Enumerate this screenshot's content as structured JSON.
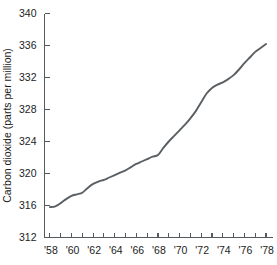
{
  "chart_data": {
    "type": "line",
    "title": "",
    "subtitle": "",
    "xlabel": "",
    "ylabel": "Carbon dioxide (parts per million)",
    "xlim": [
      1957.5,
      1978.6
    ],
    "ylim": [
      312,
      340
    ],
    "grid": false,
    "legend": "none",
    "line_color": "#5a5f63",
    "axis_color": "#555a5e",
    "background_color": "#ffffff",
    "y_ticks": [
      312,
      316,
      320,
      324,
      328,
      332,
      336,
      340
    ],
    "y_tick_labels": [
      "312",
      "316",
      "320",
      "324",
      "328",
      "332",
      "336",
      "340"
    ],
    "x_ticks": [
      1958,
      1959,
      1960,
      1961,
      1962,
      1963,
      1964,
      1965,
      1966,
      1967,
      1968,
      1969,
      1970,
      1971,
      1972,
      1973,
      1974,
      1975,
      1976,
      1977,
      1978
    ],
    "x_tick_labels": [
      "'58",
      "",
      "'60",
      "",
      "'62",
      "",
      "'64",
      "",
      "'66",
      "",
      "'68",
      "",
      "'70",
      "",
      "'72",
      "",
      "'74",
      "",
      "'76",
      "",
      "'78"
    ],
    "x_labeled_years": [
      1958,
      1960,
      1962,
      1964,
      1966,
      1968,
      1970,
      1972,
      1974,
      1976,
      1978
    ],
    "x_labeled_text": [
      "'58",
      "'60",
      "'62",
      "'64",
      "'66",
      "'68",
      "'70",
      "'72",
      "'74",
      "'76",
      "'78"
    ],
    "series": [
      {
        "name": "Atmospheric carbon dioxide concentration",
        "x": [
          1958,
          1958.5,
          1959,
          1959.5,
          1960,
          1960.5,
          1961,
          1961.5,
          1962,
          1962.5,
          1963,
          1963.5,
          1964,
          1964.5,
          1965,
          1965.5,
          1966,
          1966.5,
          1967,
          1967.5,
          1968,
          1968.5,
          1969,
          1969.5,
          1970,
          1970.5,
          1971,
          1971.5,
          1972,
          1972.5,
          1973,
          1973.5,
          1974,
          1974.5,
          1975,
          1975.5,
          1976,
          1976.5,
          1977,
          1977.5,
          1978
        ],
        "y": [
          315.8,
          315.9,
          316.3,
          316.8,
          317.2,
          317.4,
          317.6,
          318.2,
          318.7,
          319.0,
          319.2,
          319.5,
          319.8,
          320.1,
          320.4,
          320.8,
          321.2,
          321.5,
          321.8,
          322.1,
          322.3,
          323.2,
          324.0,
          324.7,
          325.4,
          326.1,
          326.9,
          327.8,
          328.9,
          330.0,
          330.7,
          331.1,
          331.4,
          331.8,
          332.3,
          333.0,
          333.8,
          334.5,
          335.2,
          335.7,
          336.2
        ]
      }
    ]
  }
}
